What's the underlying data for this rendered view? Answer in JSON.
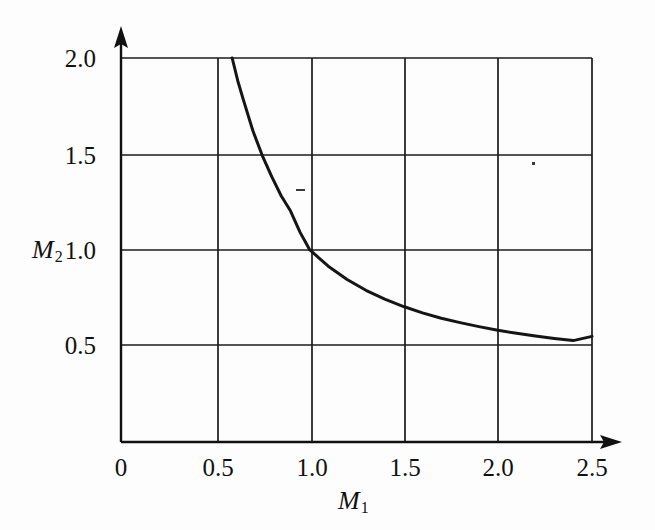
{
  "chart_data": {
    "type": "line",
    "title": "",
    "subtitle": "",
    "xlabel": "M_1",
    "ylabel": "M_2",
    "xlabel_display": "M",
    "xlabel_sub": "1",
    "ylabel_display": "M",
    "ylabel_sub": "2",
    "xlim": [
      0,
      2.5
    ],
    "ylim": [
      0,
      2.25
    ],
    "x_ticks": [
      0,
      0.5,
      1.0,
      1.5,
      2.0,
      2.5
    ],
    "x_tick_labels": [
      "0",
      "0.5",
      "1.0",
      "1.5",
      "2.0",
      "2.5"
    ],
    "y_ticks": [
      0.5,
      1.0,
      1.5,
      2.0
    ],
    "y_tick_labels": [
      "0.5",
      "1.0",
      "1.5",
      "2.0"
    ],
    "grid": true,
    "grid_x_values": [
      0.5,
      1.0,
      1.5,
      2.0,
      2.5
    ],
    "grid_y_values": [
      0.5,
      1.0,
      1.5,
      2.0
    ],
    "legend": null,
    "legend_position": "none",
    "axis_arrows": {
      "x": true,
      "y": true
    },
    "series": [
      {
        "name": "M2 vs M1",
        "color": "#151515",
        "line_width": 3,
        "x": [
          0.59,
          0.62,
          0.65,
          0.7,
          0.75,
          0.8,
          0.85,
          0.9,
          0.95,
          1.0,
          1.05,
          1.1,
          1.2,
          1.3,
          1.4,
          1.5,
          1.6,
          1.7,
          1.8,
          1.9,
          2.0,
          2.1,
          2.2,
          2.3,
          2.4,
          2.5
        ],
        "y": [
          2.0,
          1.88,
          1.78,
          1.62,
          1.49,
          1.38,
          1.28,
          1.2,
          1.09,
          1.0,
          0.955,
          0.912,
          0.842,
          0.786,
          0.74,
          0.701,
          0.668,
          0.64,
          0.617,
          0.596,
          0.577,
          0.561,
          0.547,
          0.534,
          0.523,
          0.545
        ]
      }
    ],
    "annotations": [
      {
        "name": "scan-speck-center",
        "x_px": 300,
        "y_px": 190,
        "w_px": 9,
        "h_px": 2
      },
      {
        "name": "scan-speck-upper-right",
        "x_px": 533,
        "y_px": 163,
        "w_px": 3,
        "h_px": 3
      }
    ]
  },
  "axis": {
    "x_title_text": "M",
    "x_title_sub": "1",
    "y_title_text": "M",
    "y_title_sub": "2"
  }
}
